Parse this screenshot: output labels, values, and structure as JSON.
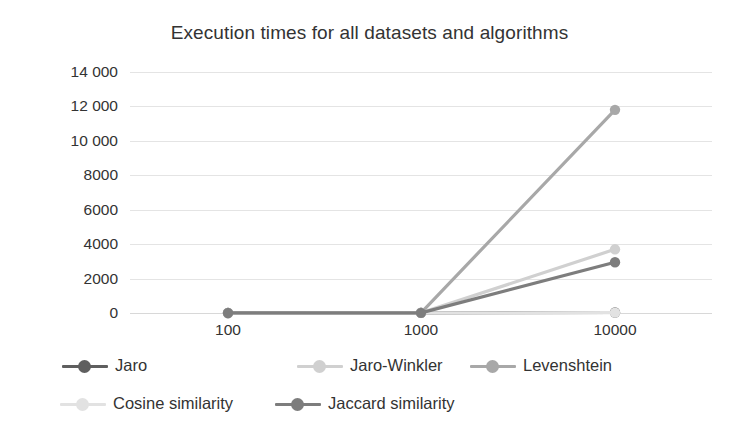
{
  "chart_data": {
    "type": "line",
    "title": "Execution times for all datasets and algorithms",
    "xlabel": "",
    "ylabel": "Time in seconds",
    "categories": [
      "100",
      "1000",
      "10000"
    ],
    "ylim": [
      0,
      14000
    ],
    "yticks": [
      0,
      2000,
      4000,
      6000,
      8000,
      10000,
      12000,
      14000
    ],
    "ytick_labels": [
      "0",
      "2000",
      "4000",
      "6000",
      "8000",
      "10 000",
      "12 000",
      "14 000"
    ],
    "grid": true,
    "legend_position": "bottom",
    "series": [
      {
        "name": "Jaro",
        "color": "#5f5f5f",
        "values": [
          2,
          8,
          30
        ]
      },
      {
        "name": "Jaro-Winkler",
        "color": "#d0d0d0",
        "values": [
          2,
          9,
          3700
        ]
      },
      {
        "name": "Levenshtein",
        "color": "#a8a8a8",
        "values": [
          3,
          12,
          11800
        ]
      },
      {
        "name": "Cosine similarity",
        "color": "#e2e2e2",
        "values": [
          1,
          4,
          20
        ]
      },
      {
        "name": "Jaccard similarity",
        "color": "#7d7d7d",
        "values": [
          2,
          10,
          2950
        ]
      }
    ]
  },
  "chart": {
    "title": "Execution times for all datasets and algorithms",
    "y_axis_title": "Time in seconds"
  },
  "legend": {
    "rows": [
      [
        {
          "label": "Jaro",
          "color": "#5f5f5f"
        },
        {
          "label": "Jaro-Winkler",
          "color": "#d0d0d0"
        },
        {
          "label": "Levenshtein",
          "color": "#a8a8a8"
        }
      ],
      [
        {
          "label": "Cosine similarity",
          "color": "#e2e2e2"
        },
        {
          "label": "Jaccard similarity",
          "color": "#7d7d7d"
        }
      ]
    ]
  }
}
